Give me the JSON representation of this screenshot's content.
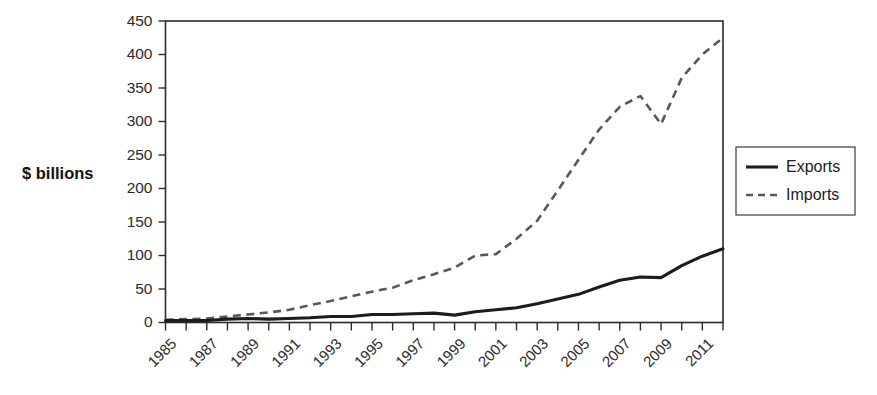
{
  "chart_data": {
    "type": "line",
    "title": "",
    "xlabel": "",
    "ylabel": "$ billions",
    "ylim": [
      0,
      450
    ],
    "xlim": [
      1985,
      2012
    ],
    "yticks": [
      0,
      50,
      100,
      150,
      200,
      250,
      300,
      350,
      400,
      450
    ],
    "xticks": [
      1985,
      1987,
      1989,
      1991,
      1993,
      1995,
      1997,
      1999,
      2001,
      2003,
      2005,
      2007,
      2009,
      2011
    ],
    "xtick_labels": [
      "1985",
      "1987",
      "1989",
      "1991",
      "1993",
      "1995",
      "1997",
      "1999",
      "2001",
      "2003",
      "2005",
      "2007",
      "2009",
      "2011"
    ],
    "xtick_rotation": 45,
    "grid": false,
    "legend_position": "right-outside",
    "x": [
      1985,
      1986,
      1987,
      1988,
      1989,
      1990,
      1991,
      1992,
      1993,
      1994,
      1995,
      1996,
      1997,
      1998,
      1999,
      2000,
      2001,
      2002,
      2003,
      2004,
      2005,
      2006,
      2007,
      2008,
      2009,
      2010,
      2011,
      2012
    ],
    "series": [
      {
        "name": "Exports",
        "style": "solid",
        "color": "#1c1c1c",
        "values": [
          3,
          3,
          3,
          5,
          6,
          5,
          6,
          7,
          9,
          9,
          12,
          12,
          13,
          14,
          11,
          16,
          19,
          22,
          28,
          35,
          42,
          53,
          63,
          68,
          67,
          85,
          99,
          110
        ]
      },
      {
        "name": "Imports",
        "style": "dashed",
        "color": "#58585a",
        "values": [
          4,
          5,
          6,
          9,
          12,
          15,
          19,
          26,
          32,
          39,
          46,
          52,
          63,
          72,
          82,
          100,
          102,
          125,
          152,
          197,
          243,
          288,
          322,
          338,
          296,
          365,
          400,
          425
        ]
      }
    ]
  },
  "legend": {
    "entries": [
      {
        "label": "Exports",
        "style": "solid"
      },
      {
        "label": "Imports",
        "style": "dashed"
      }
    ]
  },
  "axis": {
    "y_title": "$ billions"
  }
}
